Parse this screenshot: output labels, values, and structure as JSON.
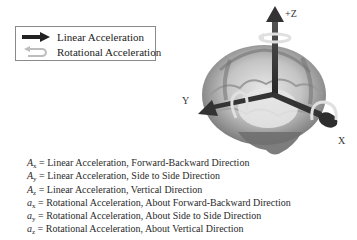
{
  "legend": {
    "items": [
      {
        "icon": "linear-arrow-icon",
        "label": "Linear Acceleration"
      },
      {
        "icon": "rotational-arrow-icon",
        "label": "Rotational Acceleration"
      }
    ]
  },
  "diagram": {
    "axes": {
      "z": "+Z",
      "y": "Y",
      "x": "X"
    },
    "colors": {
      "arrow": "#3a3a3a",
      "rotation_ring": "#d8d8d8",
      "brain_dark": "#7a7a7a",
      "brain_light": "#d6d6d6"
    }
  },
  "definitions": [
    {
      "symbol": "A",
      "sub": "x",
      "text": "= Linear Acceleration, Forward-Backward Direction"
    },
    {
      "symbol": "A",
      "sub": "y",
      "text": "= Linear Acceleration, Side to Side Direction"
    },
    {
      "symbol": "A",
      "sub": "z",
      "text": "= Linear Acceleration, Vertical Direction"
    },
    {
      "symbol": "a",
      "sub": "x",
      "text": " = Rotational Acceleration, About Forward-Backward Direction"
    },
    {
      "symbol": "a",
      "sub": "y",
      "text": " = Rotational Acceleration, About Side to Side Direction"
    },
    {
      "symbol": "a",
      "sub": "z",
      "text": " = Rotational Acceleration, About Vertical Direction"
    }
  ]
}
